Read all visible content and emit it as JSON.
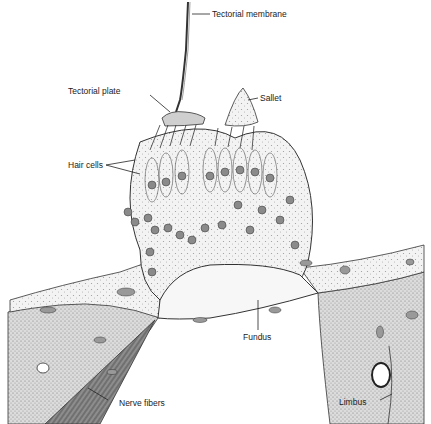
{
  "figure": {
    "labels": {
      "tectorial_membrane": "Tectorial membrane",
      "tectorial_plate": "Tectorial plate",
      "sallet": "Sallet",
      "hair_cells": "Hair cells",
      "fundus": "Fundus",
      "nerve_fibers": "Nerve fibers",
      "limbus": "Limbus"
    },
    "colors": {
      "ink": "#222222",
      "stipple_light": "#e9e9e9",
      "stipple_mid": "#d2d2d2",
      "nerve_dark": "#6a6a6a",
      "nucleus": "#8a8a8a",
      "background": "#ffffff"
    }
  }
}
